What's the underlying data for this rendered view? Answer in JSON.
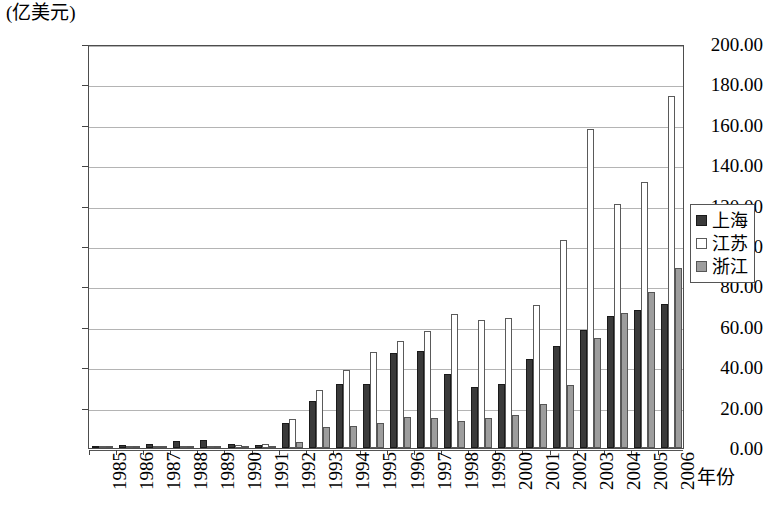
{
  "chart_data": {
    "type": "bar",
    "title": "",
    "subtitle": "",
    "xlabel": "年份",
    "ylabel": "(亿美元)",
    "ylim": [
      0,
      200
    ],
    "ytick_step": 20,
    "ytick_labels": [
      "200.00",
      "180.00",
      "160.00",
      "140.00",
      "120.00",
      "100.00",
      "80.00",
      "60.00",
      "40.00",
      "20.00",
      "0.00"
    ],
    "grid": true,
    "legend_position": "right",
    "categories": [
      "1985",
      "1986",
      "1987",
      "1988",
      "1989",
      "1990",
      "1991",
      "1992",
      "1993",
      "1994",
      "1995",
      "1996",
      "1997",
      "1998",
      "1999",
      "2000",
      "2001",
      "2002",
      "2003",
      "2004",
      "2005",
      "2006"
    ],
    "series": [
      {
        "name": "上海",
        "color": "#3a3a3a",
        "values": [
          0.8,
          1.5,
          2.1,
          3.6,
          4.2,
          1.8,
          1.5,
          12.6,
          23.2,
          31.6,
          31.9,
          47.2,
          48.1,
          36.4,
          30.2,
          31.6,
          43.9,
          50.3,
          58.5,
          65.4,
          68.5,
          71.1
        ]
      },
      {
        "name": "江苏",
        "color": "#ffffff",
        "values": [
          0.3,
          0.5,
          0.7,
          0.9,
          1.2,
          1.5,
          2.0,
          14.3,
          28.7,
          38.6,
          47.3,
          52.8,
          58.0,
          66.3,
          63.4,
          64.6,
          71.0,
          102.9,
          157.7,
          120.8,
          131.8,
          174.3
        ]
      },
      {
        "name": "浙江",
        "color": "#9d9d9d",
        "values": [
          0.1,
          0.2,
          0.3,
          0.4,
          0.6,
          0.7,
          0.9,
          2.8,
          10.2,
          11.0,
          12.5,
          15.2,
          15.1,
          13.2,
          15.1,
          16.1,
          21.7,
          31.1,
          54.5,
          66.8,
          77.2,
          88.9
        ]
      }
    ]
  },
  "legend": {
    "items": [
      {
        "label": "上海",
        "swatch": "s0"
      },
      {
        "label": "江苏",
        "swatch": "s1"
      },
      {
        "label": "浙江",
        "swatch": "s2"
      }
    ]
  }
}
